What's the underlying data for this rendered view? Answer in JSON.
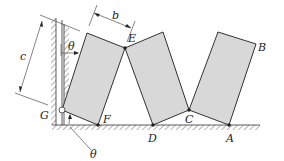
{
  "figure": {
    "labels": {
      "b": "b",
      "c": "c",
      "theta_top": "θ",
      "theta_bottom": "θ",
      "E": "E",
      "B": "B",
      "G": "G",
      "F": "F",
      "D": "D",
      "C": "C",
      "A": "A"
    },
    "colors": {
      "block_fill": "#d8d8d8",
      "stroke": "#333333"
    }
  }
}
